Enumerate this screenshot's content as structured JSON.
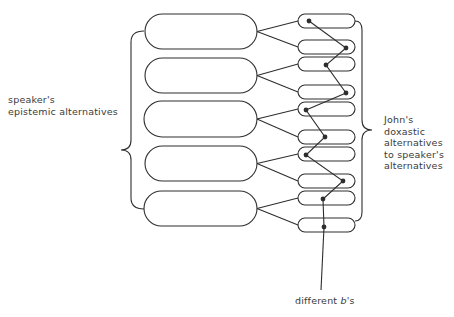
{
  "diagram": {
    "left_label": {
      "lines": [
        "speaker's",
        "epistemic alternatives"
      ]
    },
    "right_label": {
      "lines": [
        "John's",
        "doxastic",
        "alternatives",
        "to speaker's",
        "alternatives"
      ]
    },
    "bottom_label": {
      "text": "different",
      "var": "b",
      "suffix": "'s"
    },
    "large_pills": [
      {
        "x": 145,
        "y": 14,
        "w": 112,
        "h": 35
      },
      {
        "x": 145,
        "y": 58,
        "w": 112,
        "h": 35
      },
      {
        "x": 144,
        "y": 101,
        "w": 113,
        "h": 36
      },
      {
        "x": 145,
        "y": 146,
        "w": 112,
        "h": 35
      },
      {
        "x": 144,
        "y": 191,
        "w": 113,
        "h": 35
      }
    ],
    "small_pills": [
      {
        "cy": 21
      },
      {
        "cy": 47
      },
      {
        "cy": 64
      },
      {
        "cy": 92
      },
      {
        "cy": 109
      },
      {
        "cy": 137
      },
      {
        "cy": 154
      },
      {
        "cy": 181
      },
      {
        "cy": 198
      },
      {
        "cy": 225
      }
    ],
    "dots": [
      [
        309,
        21
      ],
      [
        346,
        48
      ],
      [
        326,
        65
      ],
      [
        346,
        93
      ],
      [
        306,
        110
      ],
      [
        325,
        137
      ],
      [
        306,
        155
      ],
      [
        343,
        181
      ],
      [
        323,
        199
      ],
      [
        324,
        227
      ]
    ],
    "colors": {
      "stroke": "#2e2e2e",
      "text": "#3a3a3a"
    }
  }
}
